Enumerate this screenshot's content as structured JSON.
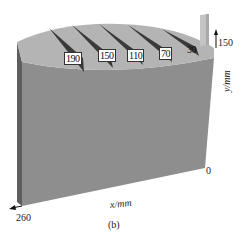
{
  "figure": {
    "panel_label": "(b)",
    "x_axis": {
      "label": "x/mm",
      "start_tick": "260",
      "end_tick": "0"
    },
    "y_axis": {
      "label": "y/mm",
      "top_tick": "150"
    },
    "notch_depth_labels": [
      "190",
      "150",
      "110",
      "70",
      "30"
    ],
    "colors": {
      "front_face": "#8e8e8e",
      "top_face": "#b4b4b4",
      "side_face": "#5e5e5e",
      "notch": "#3a3a3a",
      "pillar": "#c4c4c4"
    }
  }
}
